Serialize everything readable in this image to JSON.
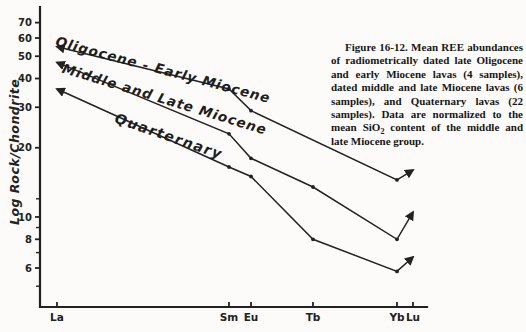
{
  "figure": {
    "caption_part1": "Figure 16-12. Mean REE abundances of radiometrically dated late Oligocene and early Miocene lavas (4 samples), dated middle and late Miocene lavas (6 samples), and Quaternary lavas (22 samples). Data are normalized to the mean SiO",
    "caption_sub": "2",
    "caption_part2": " content of the middle and late Miocene group."
  },
  "chart_data": {
    "type": "line",
    "title": "",
    "xlabel": "",
    "ylabel": "Log Rock/Chondrite",
    "y_scale": "log",
    "x_categories": [
      "La",
      "Sm",
      "Eu",
      "Tb",
      "Yb",
      "Lu"
    ],
    "y_tick_labels": [
      70,
      60,
      50,
      40,
      30,
      20,
      10,
      8,
      6
    ],
    "y_minor_ticks": [
      12,
      9,
      7,
      5
    ],
    "ylim": [
      4.5,
      80
    ],
    "grid": "off",
    "legend_position": "labels-along-lines",
    "series": [
      {
        "name": "Oligocene - Early Miocene",
        "values": {
          "La": 55,
          "Sm": 36,
          "Eu": 29,
          "Tb": null,
          "Yb": 14.5,
          "Lu": 16
        }
      },
      {
        "name": "Middle and Late Miocene",
        "values": {
          "La": 47,
          "Sm": 23,
          "Eu": 18,
          "Tb": 13.5,
          "Yb": 8,
          "Lu": 10.5
        }
      },
      {
        "name": "Quarternary",
        "values": {
          "La": 36,
          "Sm": 16.5,
          "Eu": 15,
          "Tb": 8,
          "Yb": 5.8,
          "Lu": 6.7
        }
      }
    ],
    "layout": {
      "x_px": {
        "La": 57,
        "Sm": 229,
        "Eu": 251,
        "Tb": 313,
        "Yb": 397,
        "Lu": 413
      },
      "y_px_at_10": 217,
      "px_per_decade": 230,
      "axis_x": 40,
      "axis_top": 7,
      "axis_bottom": 307,
      "axis_right": 427,
      "ink": "#222222",
      "paper": "#fcfbf9"
    }
  }
}
